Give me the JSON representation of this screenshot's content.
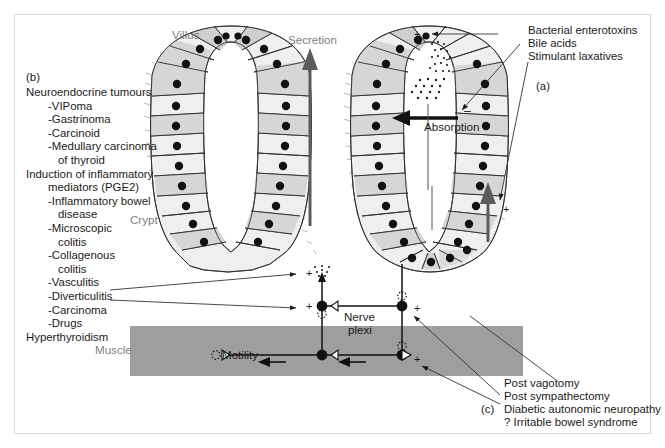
{
  "figure": {
    "panel_b_tag": "(b)",
    "panel_a_tag": "(a)",
    "panel_c_tag": "(c)"
  },
  "labels": {
    "villus": "Villus",
    "crypt": "Crypt",
    "secretion": "Secretion",
    "absorption": "Absorption",
    "motility": "Motility",
    "muscle": "Muscle",
    "nerve_plexi_line1": "Nerve",
    "nerve_plexi_line2": "plexi"
  },
  "signs": {
    "plus": "+",
    "minus": "–"
  },
  "left_list": [
    {
      "text": "Neuroendocrine tumours",
      "indent": 1
    },
    {
      "text": "-VIPoma",
      "indent": 2
    },
    {
      "text": "-Gastrinoma",
      "indent": 2
    },
    {
      "text": "-Carcinoid",
      "indent": 2
    },
    {
      "text": "-Medullary carcinoma",
      "indent": 2
    },
    {
      "text": "of thyroid",
      "indent": 3
    },
    {
      "text": "Induction of inflammatory",
      "indent": 1
    },
    {
      "text": "mediators (PGE2)",
      "indent": 2
    },
    {
      "text": "-Inflammatory bowel",
      "indent": 2
    },
    {
      "text": "disease",
      "indent": 3
    },
    {
      "text": "-Microscopic",
      "indent": 2
    },
    {
      "text": "colitis",
      "indent": 3
    },
    {
      "text": "-Collagenous",
      "indent": 2
    },
    {
      "text": "colitis",
      "indent": 3
    },
    {
      "text": "-Vasculitis",
      "indent": 2
    },
    {
      "text": "-Diverticulitis",
      "indent": 2
    },
    {
      "text": "-Carcinoma",
      "indent": 2
    },
    {
      "text": "-Drugs",
      "indent": 2
    },
    {
      "text": "Hyperthyroidism",
      "indent": 1
    }
  ],
  "top_right_list": [
    "Bacterial enterotoxins",
    "Bile acids",
    "Stimulant laxatives"
  ],
  "bottom_right_list": [
    "Post vagotomy",
    "Post sympathectomy",
    "Diabetic autonomic neuropathy",
    "? Irritable bowel syndrome"
  ],
  "colors": {
    "muscle_band": "#9e9e9e",
    "arrow_gray": "#5b5b5b",
    "cell_light": "#f2f2f2",
    "cell_mid": "#d8d8d8",
    "cell_dark": "#c4c4c4",
    "nucleus": "#111111",
    "border": "#d9d9d9",
    "text": "#1a1a1a",
    "gray_text": "#808080"
  }
}
